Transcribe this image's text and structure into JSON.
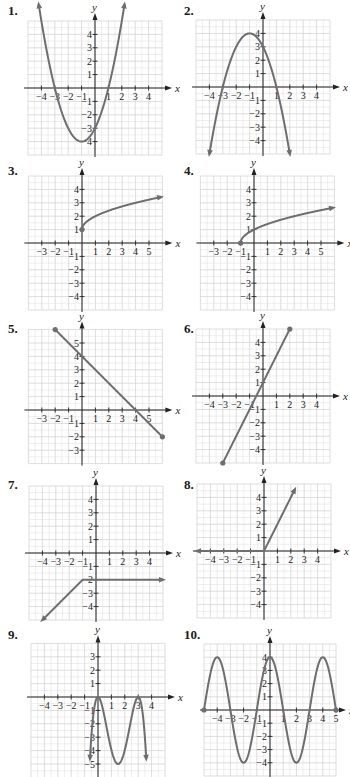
{
  "style": {
    "curve_color": "#6e6e70",
    "grid_color": "#d4d4d4",
    "axis_color": "#222222"
  },
  "chart_data": [
    {
      "id": 1,
      "label": "1.",
      "type": "line",
      "title": "",
      "xlabel": "x",
      "ylabel": "y",
      "xlim": [
        -5,
        5
      ],
      "ylim": [
        -5,
        5
      ],
      "xticks": [
        -4,
        -3,
        -2,
        -1,
        1,
        2,
        3,
        4
      ],
      "yticks": [
        -4,
        -3,
        -2,
        -1,
        1,
        2,
        3,
        4
      ],
      "grid": true,
      "function": "(x+1)^2-4",
      "domain": [
        -4.2,
        2.2
      ],
      "ends": [
        "arrow",
        "arrow"
      ],
      "key_points": [
        [
          -3,
          0
        ],
        [
          1,
          0
        ],
        [
          -1,
          -4
        ],
        [
          0,
          -3
        ]
      ],
      "panel": {
        "left": 8,
        "top": 4,
        "ox": 95,
        "oy": 88,
        "unit": 13.4,
        "gx": [
          -5,
          5
        ],
        "gy": [
          -5,
          5
        ]
      }
    },
    {
      "id": 2,
      "label": "2.",
      "type": "line",
      "title": "",
      "xlabel": "x",
      "ylabel": "y",
      "xlim": [
        -5,
        5
      ],
      "ylim": [
        -5,
        5
      ],
      "xticks": [
        -4,
        -3,
        -2,
        -1,
        1,
        2,
        3,
        4
      ],
      "yticks": [
        -4,
        -3,
        -2,
        -1,
        1,
        2,
        3,
        4
      ],
      "grid": true,
      "function": "-(x+1)^2+4",
      "domain": [
        -4,
        2
      ],
      "ends": [
        "arrow",
        "arrow"
      ],
      "key_points": [
        [
          -3,
          0
        ],
        [
          1,
          0
        ],
        [
          -1,
          4
        ],
        [
          0,
          3
        ]
      ],
      "panel": {
        "left": 184,
        "top": 4,
        "ox": 263,
        "oy": 87,
        "unit": 13.4,
        "gx": [
          -5,
          5
        ],
        "gy": [
          -5,
          5
        ]
      }
    },
    {
      "id": 3,
      "label": "3.",
      "type": "line",
      "title": "",
      "xlabel": "x",
      "ylabel": "y",
      "xlim": [
        -4,
        6
      ],
      "ylim": [
        -5,
        5
      ],
      "xticks": [
        -3,
        -2,
        -1,
        1,
        2,
        3,
        4,
        5
      ],
      "yticks": [
        -4,
        -3,
        -2,
        -1,
        1,
        2,
        3,
        4
      ],
      "grid": true,
      "function": "sqrt(x)+1",
      "domain": [
        0,
        5.9
      ],
      "ends": [
        "dot",
        "arrow"
      ],
      "key_points": [
        [
          0,
          1
        ],
        [
          1,
          2
        ],
        [
          4,
          3
        ]
      ],
      "panel": {
        "left": 8,
        "top": 164,
        "ox": 82,
        "oy": 243,
        "unit": 13.4,
        "gx": [
          -4,
          6
        ],
        "gy": [
          -5,
          5
        ]
      }
    },
    {
      "id": 4,
      "label": "4.",
      "type": "line",
      "title": "",
      "xlabel": "x",
      "ylabel": "y",
      "xlim": [
        -4,
        6
      ],
      "ylim": [
        -5,
        5
      ],
      "xticks": [
        -3,
        -2,
        -1,
        1,
        2,
        3,
        4,
        5
      ],
      "yticks": [
        -4,
        -3,
        -2,
        -1,
        1,
        2,
        3,
        4
      ],
      "grid": true,
      "function": "sqrt(x+1)",
      "domain": [
        -1,
        5.9
      ],
      "ends": [
        "dot",
        "arrow"
      ],
      "key_points": [
        [
          -1,
          0
        ],
        [
          0,
          1
        ],
        [
          3,
          2
        ]
      ],
      "panel": {
        "left": 184,
        "top": 164,
        "ox": 254,
        "oy": 243,
        "unit": 13.4,
        "gx": [
          -4,
          6
        ],
        "gy": [
          -5,
          5
        ]
      }
    },
    {
      "id": 5,
      "label": "5.",
      "type": "line",
      "title": "",
      "xlabel": "x",
      "ylabel": "y",
      "xlim": [
        -4,
        6
      ],
      "ylim": [
        -4,
        6
      ],
      "xticks": [
        -3,
        -2,
        -1,
        1,
        2,
        3,
        4,
        5
      ],
      "yticks": [
        -3,
        -2,
        -1,
        1,
        2,
        3,
        4,
        5
      ],
      "grid": true,
      "function": "-x+4",
      "domain": [
        -2,
        6
      ],
      "ends": [
        "dot",
        "dot"
      ],
      "key_points": [
        [
          -2,
          6
        ],
        [
          0,
          4
        ],
        [
          4,
          0
        ],
        [
          6,
          -2
        ]
      ],
      "panel": {
        "left": 8,
        "top": 322,
        "ox": 82,
        "oy": 410,
        "unit": 13.4,
        "gx": [
          -4,
          6
        ],
        "gy": [
          -4,
          6
        ]
      }
    },
    {
      "id": 6,
      "label": "6.",
      "type": "line",
      "title": "",
      "xlabel": "x",
      "ylabel": "y",
      "xlim": [
        -5,
        5
      ],
      "ylim": [
        -5,
        5
      ],
      "xticks": [
        -4,
        -3,
        -2,
        -1,
        1,
        2,
        3,
        4
      ],
      "yticks": [
        -4,
        -3,
        -2,
        -1,
        1,
        2,
        3,
        4
      ],
      "grid": true,
      "function": "2x+1",
      "domain": [
        -3,
        2
      ],
      "ends": [
        "dot",
        "dot"
      ],
      "key_points": [
        [
          -3,
          -5
        ],
        [
          -1,
          -1
        ],
        [
          0,
          1
        ],
        [
          2,
          5
        ]
      ],
      "panel": {
        "left": 184,
        "top": 322,
        "ox": 263,
        "oy": 396,
        "unit": 13.4,
        "gx": [
          -5,
          5
        ],
        "gy": [
          -5,
          5
        ]
      }
    },
    {
      "id": 7,
      "label": "7.",
      "type": "line",
      "title": "",
      "xlabel": "x",
      "ylabel": "y",
      "xlim": [
        -5,
        5
      ],
      "ylim": [
        -5,
        5
      ],
      "xticks": [
        -4,
        -3,
        -2,
        -1,
        1,
        2,
        3,
        4
      ],
      "yticks": [
        -4,
        -3,
        -2,
        -1,
        1,
        2,
        3,
        4
      ],
      "grid": true,
      "function": "piecewise: x+(-1) for x<=-1 shifted; y=x-1 for x<-1, y=-2 for x>=-1",
      "domain": [
        -4,
        5
      ],
      "ends": [
        "arrow",
        "arrow"
      ],
      "key_points": [
        [
          -4,
          -5
        ],
        [
          -1,
          -2
        ],
        [
          5,
          -2
        ]
      ],
      "panel": {
        "left": 8,
        "top": 478,
        "ox": 96,
        "oy": 553,
        "unit": 13.4,
        "gx": [
          -5,
          5
        ],
        "gy": [
          -5,
          5
        ]
      }
    },
    {
      "id": 8,
      "label": "8.",
      "type": "line",
      "title": "",
      "xlabel": "x",
      "ylabel": "y",
      "xlim": [
        -5,
        5
      ],
      "ylim": [
        -5,
        5
      ],
      "xticks": [
        -4,
        -3,
        -2,
        -1,
        1,
        2,
        3,
        4
      ],
      "yticks": [
        -4,
        -3,
        -2,
        -1,
        1,
        2,
        3,
        4
      ],
      "grid": true,
      "function": "y=0 for x<0, y=2x for x>=0",
      "domain": [
        -5,
        2.3
      ],
      "ends": [
        "arrow",
        "arrow"
      ],
      "key_points": [
        [
          -5,
          0
        ],
        [
          0,
          0
        ],
        [
          2.3,
          4.6
        ]
      ],
      "panel": {
        "left": 184,
        "top": 478,
        "ox": 264,
        "oy": 551,
        "unit": 13.4,
        "gx": [
          -5,
          5
        ],
        "gy": [
          -5,
          5
        ]
      }
    },
    {
      "id": 9,
      "label": "9.",
      "type": "line",
      "title": "",
      "xlabel": "x",
      "ylabel": "y",
      "xlim": [
        -5,
        5
      ],
      "ylim": [
        -6,
        4
      ],
      "xticks": [
        -4,
        -3,
        -2,
        -1,
        1,
        2,
        3,
        4
      ],
      "yticks": [
        -5,
        -4,
        -3,
        -2,
        -1,
        1,
        2,
        3
      ],
      "grid": true,
      "function": "-x^2(x-3)^2 scaled (zeros at 0 and 3, min -5 near x=1.5)",
      "domain": [
        -0.6,
        3.6
      ],
      "ends": [
        "arrow",
        "arrow"
      ],
      "key_points": [
        [
          0,
          0
        ],
        [
          1.5,
          -5
        ],
        [
          3,
          0
        ]
      ],
      "panel": {
        "left": 8,
        "top": 628,
        "ox": 98,
        "oy": 697,
        "unit": 13.4,
        "gx": [
          -5,
          5
        ],
        "gy": [
          -6,
          4
        ]
      }
    },
    {
      "id": 10,
      "label": "10.",
      "type": "line",
      "title": "",
      "xlabel": "x",
      "ylabel": "y",
      "xlim": [
        -5,
        5
      ],
      "ylim": [
        -5,
        5
      ],
      "xticks": [
        -4,
        -3,
        -2,
        -1,
        1,
        2,
        3,
        4,
        5
      ],
      "yticks": [
        -4,
        -3,
        -2,
        -1,
        1,
        2,
        3,
        4
      ],
      "grid": true,
      "function": "4cos(pi*x/2)",
      "domain": [
        -5,
        5
      ],
      "ends": [
        "dot",
        "dot"
      ],
      "key_points": [
        [
          -5,
          0
        ],
        [
          -4,
          4
        ],
        [
          -3,
          0
        ],
        [
          -2,
          -4
        ],
        [
          -1,
          0
        ],
        [
          0,
          4
        ],
        [
          1,
          0
        ],
        [
          2,
          -4
        ],
        [
          3,
          0
        ],
        [
          4,
          4
        ],
        [
          5,
          0
        ]
      ],
      "panel": {
        "left": 184,
        "top": 628,
        "ox": 270,
        "oy": 710,
        "unit": 13.2,
        "gx": [
          -5,
          5
        ],
        "gy": [
          -5,
          5
        ]
      }
    }
  ]
}
